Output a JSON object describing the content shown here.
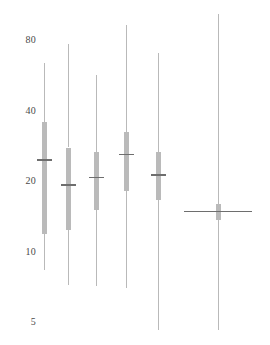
{
  "chart_data": {
    "type": "box",
    "title": "",
    "xlabel": "",
    "ylabel": "",
    "yscale": "log",
    "ylim": [
      4.2,
      110
    ],
    "grid": false,
    "legend": null,
    "y_ticks": [
      {
        "label": "80",
        "value": 80
      },
      {
        "label": "40",
        "value": 40
      },
      {
        "label": "20",
        "value": 20
      },
      {
        "label": "10",
        "value": 10
      },
      {
        "label": "5",
        "value": 5
      }
    ],
    "categories": [
      "1",
      "2",
      "3",
      "4",
      "5",
      "6"
    ],
    "boxes": [
      {
        "category": "1",
        "whisker_low": 8.3,
        "q1": 11.9,
        "median": 24.6,
        "q3": 35.6,
        "whisker_high": 63.8,
        "style": "narrow"
      },
      {
        "category": "2",
        "whisker_low": 7.2,
        "q1": 12.4,
        "median": 19.2,
        "q3": 27.8,
        "whisker_high": 77.0,
        "style": "narrow"
      },
      {
        "category": "3",
        "whisker_low": 7.1,
        "q1": 15.1,
        "median": 20.7,
        "q3": 26.6,
        "whisker_high": 56.8,
        "style": "narrow"
      },
      {
        "category": "4",
        "whisker_low": 7.0,
        "q1": 18.2,
        "median": 26.0,
        "q3": 32.4,
        "whisker_high": 92.5,
        "style": "narrow"
      },
      {
        "category": "5",
        "whisker_low": 4.6,
        "q1": 16.6,
        "median": 21.2,
        "q3": 26.6,
        "whisker_high": 70.4,
        "style": "narrow"
      },
      {
        "category": "6",
        "whisker_low": 4.6,
        "q1": 13.6,
        "median": 14.8,
        "q3": 16.0,
        "whisker_high": 103.0,
        "style": "wide"
      }
    ],
    "colors": {
      "box_fill": "#b4b4b4",
      "whisker": "#b9b9b9",
      "median": "#6e6e6e",
      "tick_text": "#4a4a4a",
      "background": "#ffffff"
    }
  },
  "layout": {
    "width": 270,
    "height": 345,
    "box_x_centers": [
      44,
      68,
      96,
      126,
      158,
      218
    ],
    "box_widths_narrow": 5,
    "box_width_wide": 5,
    "median_width_narrow": 15,
    "median_width_wide": 68,
    "y_pixel_map": [
      {
        "value": 80,
        "y": 40
      },
      {
        "value": 40,
        "y": 110
      },
      {
        "value": 20,
        "y": 182
      },
      {
        "value": 10,
        "y": 252
      },
      {
        "value": 5,
        "y": 322
      }
    ],
    "tick_label_x": 10
  }
}
